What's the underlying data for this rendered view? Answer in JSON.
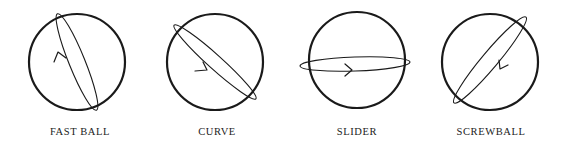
{
  "pitches": [
    {
      "name": "FAST BALL"
    },
    {
      "name": "CURVE"
    },
    {
      "name": "SLIDER"
    },
    {
      "name": "SCREWBALL"
    }
  ],
  "colors": {
    "stroke": "#1a1a1a",
    "background": "#ffffff"
  }
}
